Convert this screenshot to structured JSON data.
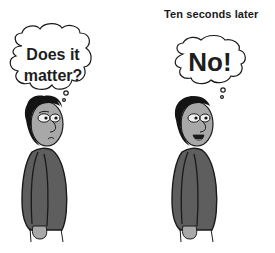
{
  "comic": {
    "caption": "Ten seconds later",
    "panels": [
      {
        "id": "before",
        "thought_line1": "Does it",
        "thought_line2": "matter?",
        "expression": "puzzled"
      },
      {
        "id": "after",
        "thought": "No!",
        "expression": "smiling"
      }
    ]
  },
  "colors": {
    "background": "#ffffff",
    "outline": "#1a1a1a",
    "skin": "#a8a8a8",
    "sweater": "#5e5e5e",
    "hair": "#141414",
    "eye_white": "#f2f2f2",
    "text": "#1e1e1e"
  }
}
